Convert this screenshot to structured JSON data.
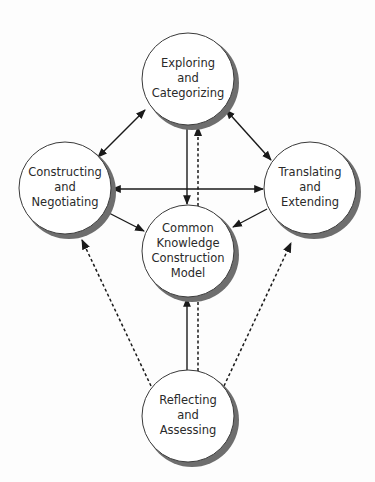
{
  "diagram": {
    "nodes": {
      "top": {
        "lines": [
          "Exploring",
          "and",
          "Categorizing"
        ]
      },
      "left": {
        "lines": [
          "Constructing",
          "and",
          "Negotiating"
        ]
      },
      "right": {
        "lines": [
          "Translating",
          "and",
          "Extending"
        ]
      },
      "center": {
        "lines": [
          "Common",
          "Knowledge",
          "Construction",
          "Model"
        ]
      },
      "bottom": {
        "lines": [
          "Reflecting",
          "and",
          "Assessing"
        ]
      }
    },
    "edges": [
      {
        "from": "top",
        "to": "left",
        "style": "solid",
        "direction": "both"
      },
      {
        "from": "top",
        "to": "right",
        "style": "solid",
        "direction": "both"
      },
      {
        "from": "left",
        "to": "right",
        "style": "solid",
        "direction": "both"
      },
      {
        "from": "top",
        "to": "center",
        "style": "solid",
        "direction": "forward"
      },
      {
        "from": "left",
        "to": "center",
        "style": "solid",
        "direction": "forward"
      },
      {
        "from": "right",
        "to": "center",
        "style": "solid",
        "direction": "forward"
      },
      {
        "from": "bottom",
        "to": "center",
        "style": "solid",
        "direction": "forward"
      },
      {
        "from": "bottom",
        "to": "top",
        "style": "dashed",
        "direction": "forward"
      },
      {
        "from": "bottom",
        "to": "left",
        "style": "dashed",
        "direction": "forward"
      },
      {
        "from": "bottom",
        "to": "right",
        "style": "dashed",
        "direction": "forward"
      }
    ]
  }
}
